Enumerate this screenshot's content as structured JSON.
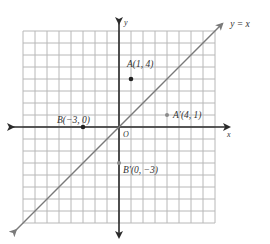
{
  "diagram": {
    "type": "coordinate-plane-reflection",
    "grid": {
      "xmin": -8,
      "xmax": 8,
      "ymin": -8,
      "ymax": 8,
      "cell_px": 12,
      "origin_px": [
        119,
        127
      ]
    },
    "axes": {
      "x_label": "x",
      "y_label": "y",
      "origin_label": "O"
    },
    "line": {
      "label": "y = x",
      "equation": "y = x"
    },
    "points": [
      {
        "id": "A",
        "label": "A(1, 4)",
        "x": 1,
        "y": 4,
        "color": "#222222",
        "kind": "original"
      },
      {
        "id": "B",
        "label": "B(−3, 0)",
        "x": -3,
        "y": 0,
        "color": "#222222",
        "kind": "original"
      },
      {
        "id": "A_prime",
        "label": "A′(4, 1)",
        "x": 4,
        "y": 1,
        "color": "#8a8a8a",
        "kind": "image"
      },
      {
        "id": "B_prime",
        "label": "B′(0, −3)",
        "x": 0,
        "y": -3,
        "color": "#8a8a8a",
        "kind": "image"
      }
    ],
    "colors": {
      "grid": "#b8b8b8",
      "axis": "#2a2a2a",
      "line": "#7a7a7a"
    }
  }
}
